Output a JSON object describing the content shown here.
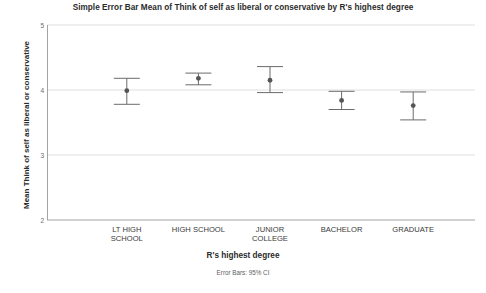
{
  "chart_data": {
    "type": "scatter",
    "title": "Simple Error Bar Mean of Think of self as liberal or conservative by R's highest degree",
    "xlabel": "R's highest degree",
    "ylabel": "Mean Think of self as liberal or conservative",
    "footnote": "Error Bars: 95% CI",
    "categories": [
      "LT HIGH\nSCHOOL",
      "HIGH SCHOOL",
      "JUNIOR\nCOLLEGE",
      "BACHELOR",
      "GRADUATE"
    ],
    "values": [
      3.99,
      4.18,
      4.15,
      3.84,
      3.76
    ],
    "ci_lower": [
      3.78,
      4.08,
      3.96,
      3.7,
      3.54
    ],
    "ci_upper": [
      4.18,
      4.26,
      4.36,
      3.98,
      3.97
    ],
    "ylim": [
      2,
      5
    ],
    "yticks": [
      "5",
      "4",
      "3",
      "2"
    ],
    "ytick_values": [
      5,
      4,
      3,
      2
    ],
    "grid": true,
    "legend": "none",
    "marker_color": "#555555",
    "errorbar_color": "#6b6b6b",
    "grid_color": "#d6d6d6",
    "axis_color": "#9a9a9a"
  }
}
